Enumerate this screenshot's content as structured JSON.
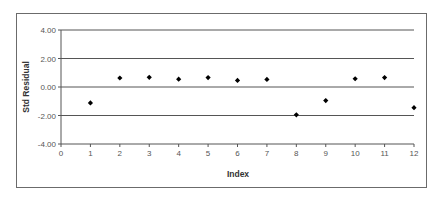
{
  "chart_data": {
    "type": "scatter",
    "title": "",
    "xlabel": "Index",
    "ylabel": "Std Residual",
    "xlim": [
      0,
      12
    ],
    "ylim": [
      -4,
      4
    ],
    "x_ticks": [
      "0",
      "1",
      "2",
      "3",
      "4",
      "5",
      "6",
      "7",
      "8",
      "9",
      "10",
      "11",
      "12"
    ],
    "y_ticks": [
      "4.00",
      "2.00",
      "0.00",
      "-2.00",
      "-4.00"
    ],
    "y_tick_values": [
      4,
      2,
      0,
      -2,
      -4
    ],
    "grid": "horizontal",
    "legend": null,
    "marker": "diamond",
    "marker_color": "#000000",
    "series": [
      {
        "name": "Std Residual",
        "x": [
          1,
          2,
          3,
          4,
          5,
          6,
          7,
          8,
          9,
          10,
          11,
          12
        ],
        "y": [
          -1.12,
          0.63,
          0.68,
          0.55,
          0.66,
          0.46,
          0.53,
          -1.95,
          -0.95,
          0.58,
          0.66,
          -1.45
        ]
      }
    ]
  }
}
